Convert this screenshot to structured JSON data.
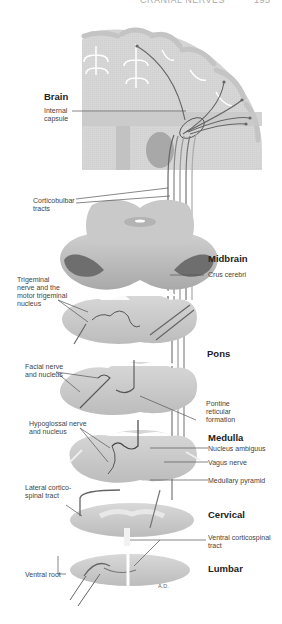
{
  "header": {
    "running_title": "CRANIAL NERVES",
    "page_number": "195"
  },
  "figure": {
    "sections": {
      "brain": "Brain",
      "midbrain": "Midbrain",
      "pons": "Pons",
      "medulla": "Medulla",
      "cervical": "Cervical",
      "lumbar": "Lumbar"
    },
    "labels": {
      "internal_capsule": "Internal\ncapsule",
      "corticobulbar_tracts": "Corticobulbar\ntracts",
      "crus_cerebri": "Crus cerebri",
      "trigeminal": "Trigeminal\nnerve and the\nmotor trigeminal\nnucleus",
      "facial": "Facial nerve\nand nucleus",
      "pontine_reticular": "Pontine\nreticular\nformation",
      "hypoglossal": "Hypoglossal nerve\nand nucleus",
      "nucleus_ambiguus": "Nucleus ambiguus",
      "vagus_nerve": "Vagus nerve",
      "medullary_pyramid": "Medullary pyramid",
      "lateral_corticospinal": "Lateral cortico-\nspinal tract",
      "ventral_corticospinal": "Ventral corticospinal\ntract",
      "ventral_root": "Ventral root"
    },
    "artist_signature": "A.D.",
    "colors": {
      "tissue_light": "#d9d9d9",
      "tissue_mid": "#bdbdbd",
      "tissue_dark": "#6e6e6e",
      "tract_line": "#555555",
      "leader_line": "#444444"
    }
  }
}
